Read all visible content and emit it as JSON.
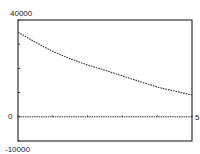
{
  "chart_data": {
    "type": "line",
    "title": "",
    "xlabel": "",
    "ylabel": "",
    "xlim": [
      0,
      5
    ],
    "ylim": [
      -10000,
      40000
    ],
    "x_tick_labels": [
      {
        "value": 5,
        "label": "5"
      }
    ],
    "y_tick_labels": [
      {
        "value": 40000,
        "label": "40000"
      },
      {
        "value": 0,
        "label": "0"
      },
      {
        "value": -10000,
        "label": "-10000"
      }
    ],
    "y_ticks": [
      -10000,
      0,
      10000,
      20000,
      30000,
      40000
    ],
    "x_ticks": [
      0,
      1,
      2,
      3,
      4,
      5
    ],
    "grid": false,
    "legend": null,
    "series": [
      {
        "name": "curve",
        "style": "dotted-step",
        "x": [
          0,
          0.5,
          1,
          1.5,
          2,
          2.5,
          3,
          3.5,
          4,
          4.5,
          5
        ],
        "values": [
          35000,
          30800,
          27000,
          24000,
          21400,
          19200,
          16900,
          14600,
          12300,
          10600,
          9000
        ]
      },
      {
        "name": "zero-line",
        "style": "dotted",
        "x": [
          0,
          5
        ],
        "values": [
          0,
          0
        ]
      }
    ]
  },
  "colors": {
    "frame": "#333333",
    "curve": "#333333",
    "text": "#222222",
    "background": "#ffffff"
  }
}
